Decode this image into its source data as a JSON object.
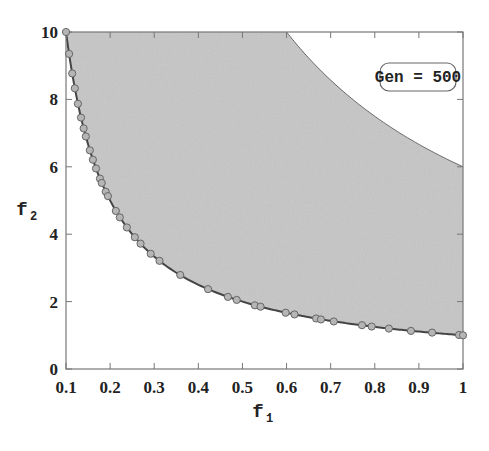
{
  "chart_data": {
    "type": "scatter",
    "title": "",
    "annotation": "Gen = 500",
    "xlabel": "f1",
    "ylabel": "f2",
    "xlim": [
      0.1,
      1.0
    ],
    "ylim": [
      0,
      10
    ],
    "x_ticks": [
      "0.1",
      "0.2",
      "0.3",
      "0.4",
      "0.5",
      "0.6",
      "0.7",
      "0.8",
      "0.9",
      "1"
    ],
    "y_ticks": [
      "0",
      "2",
      "4",
      "6",
      "8",
      "10"
    ],
    "grid": false,
    "feasible_region": {
      "lower_boundary": "f2 = 1/f1",
      "upper_boundary": "f2 = 6/f1",
      "fill_color": "#c8c8c8"
    },
    "series": [
      {
        "name": "Population (Gen 500)",
        "marker": "circle",
        "marker_color": "#b0b0b0",
        "x": [
          0.1,
          0.107,
          0.114,
          0.12,
          0.127,
          0.134,
          0.14,
          0.145,
          0.154,
          0.161,
          0.168,
          0.177,
          0.181,
          0.19,
          0.195,
          0.213,
          0.222,
          0.238,
          0.256,
          0.269,
          0.292,
          0.312,
          0.359,
          0.422,
          0.467,
          0.487,
          0.528,
          0.541,
          0.598,
          0.618,
          0.667,
          0.678,
          0.707,
          0.771,
          0.793,
          0.832,
          0.882,
          0.93,
          0.991,
          1.0
        ],
        "y": [
          10.0,
          9.35,
          8.77,
          8.33,
          7.87,
          7.46,
          7.14,
          6.9,
          6.49,
          6.21,
          5.95,
          5.65,
          5.52,
          5.26,
          5.13,
          4.69,
          4.5,
          4.2,
          3.91,
          3.72,
          3.42,
          3.21,
          2.79,
          2.37,
          2.14,
          2.05,
          1.89,
          1.85,
          1.67,
          1.62,
          1.5,
          1.47,
          1.41,
          1.3,
          1.26,
          1.2,
          1.13,
          1.08,
          1.01,
          1.0
        ]
      }
    ]
  },
  "annotation_box": {
    "label": "Gen = 500"
  },
  "axes": {
    "x_label": "f",
    "x_label_sub": "1",
    "y_label": "f",
    "y_label_sub": "2"
  },
  "colors": {
    "region_fill": "#c6c6c6",
    "curve": "#444444",
    "marker_fill": "#b5b5b5",
    "marker_stroke": "#666666",
    "frame": "#777777"
  }
}
